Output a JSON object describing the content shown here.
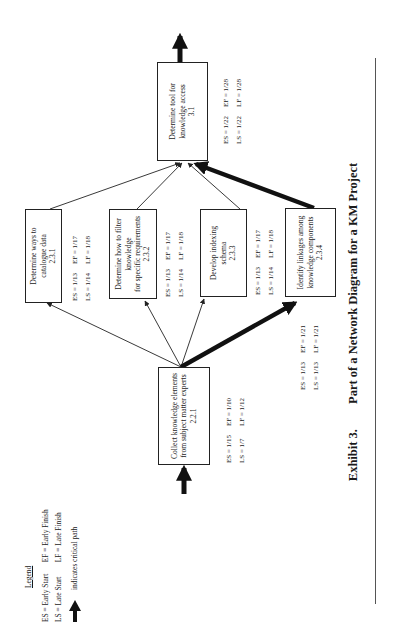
{
  "orientation": "rotated-90-ccw",
  "legend": {
    "title": "Legend",
    "items": [
      {
        "abbr": "ES = Early Start",
        "pair": "EF = Early Finish"
      },
      {
        "abbr": "LS = Late Start",
        "pair": "LF = Late Finish"
      }
    ],
    "critical_path_label": "indicates critical path",
    "critical_path_icon": "thick-arrow-icon"
  },
  "nodes": [
    {
      "id": "2.2.1",
      "lines": [
        "Collect knowledge elements",
        "from subject matter experts"
      ],
      "code": "2.2.1",
      "es": "ES = 1/15",
      "ef": "EF = 1/10",
      "ls": "LS = 1/7",
      "lf": "LF = 1/12"
    },
    {
      "id": "2.3.1",
      "lines": [
        "Determine ways to catalogue data"
      ],
      "code": "2.3.1",
      "es": "ES = 1/13",
      "ef": "EF = 1/17",
      "ls": "LS = 1/14",
      "lf": "LF = 1/18"
    },
    {
      "id": "2.3.2",
      "lines": [
        "Determine how to filter",
        "knowledge",
        "for specific requirements"
      ],
      "code": "2.3.2",
      "es": "ES = 1/13",
      "ef": "EF = 1/17",
      "ls": "LS = 1/14",
      "lf": "LF = 1/18"
    },
    {
      "id": "2.3.3",
      "lines": [
        "Develop indexing schema"
      ],
      "code": "2.3.3",
      "es": "ES = 1/13",
      "ef": "EF = 1/17",
      "ls": "LS = 1/14",
      "lf": "LF = 1/18"
    },
    {
      "id": "2.3.4",
      "lines": [
        "Identify linkages among",
        "knowledge components"
      ],
      "code": "2.3.4",
      "es": "ES = 1/13",
      "ef": "EF = 1/21",
      "ls": "LS = 1/13",
      "lf": "LF = 1/21"
    },
    {
      "id": "3.1",
      "lines": [
        "Determine tool  for",
        "knowledge access"
      ],
      "code": "3.1",
      "es": "ES = 1/22",
      "ef": "EF = 1/28",
      "ls": "LS = 1/22",
      "lf": "LF = 1/28"
    }
  ],
  "edges": [
    {
      "from": "start",
      "to": "2.2.1",
      "critical": true
    },
    {
      "from": "2.2.1",
      "to": "2.3.1",
      "critical": false
    },
    {
      "from": "2.2.1",
      "to": "2.3.2",
      "critical": false
    },
    {
      "from": "2.2.1",
      "to": "2.3.3",
      "critical": false
    },
    {
      "from": "2.2.1",
      "to": "2.3.4",
      "critical": true
    },
    {
      "from": "2.3.1",
      "to": "3.1",
      "critical": false
    },
    {
      "from": "2.3.2",
      "to": "3.1",
      "critical": false
    },
    {
      "from": "2.3.3",
      "to": "3.1",
      "critical": false
    },
    {
      "from": "2.3.4",
      "to": "3.1",
      "critical": true
    },
    {
      "from": "3.1",
      "to": "end",
      "critical": true
    }
  ],
  "caption": {
    "number": "Exhibit 3.",
    "title": "Part of a Network Diagram for a KM Project"
  },
  "colors": {
    "line": "#222222",
    "background": "#ffffff",
    "rule": "#555555"
  }
}
